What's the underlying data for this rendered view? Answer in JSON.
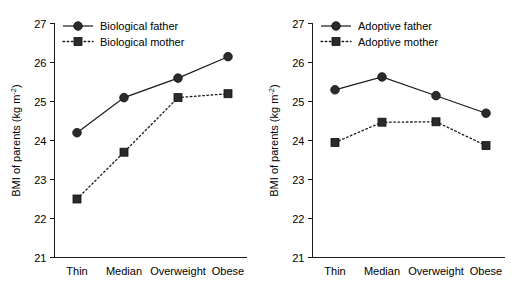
{
  "figure": {
    "panel_count": 2,
    "background": "#ffffff",
    "ink_color": "#1a1a1a"
  },
  "chart_data": [
    {
      "type": "line",
      "panel": "left",
      "title": "",
      "xlabel": "",
      "ylabel": "BMI of parents (kg m",
      "ylabel_sup": "-2",
      "ylabel_close": ")",
      "categories": [
        "Thin",
        "Median",
        "Overweight",
        "Obese"
      ],
      "ylim": [
        21,
        27
      ],
      "yticks": [
        21,
        22,
        23,
        24,
        25,
        26,
        27
      ],
      "ytick_labels": [
        "21",
        "22",
        "23",
        "24",
        "25",
        "26",
        "27"
      ],
      "grid": false,
      "legend_position": "top-left-inside",
      "series": [
        {
          "name": "Biological father",
          "marker": "circle",
          "linestyle": "solid",
          "color": "#2b2b2b",
          "values": [
            24.2,
            25.1,
            25.6,
            26.15
          ]
        },
        {
          "name": "Biological mother",
          "marker": "square",
          "linestyle": "dotted",
          "color": "#2b2b2b",
          "values": [
            22.5,
            23.7,
            25.1,
            25.2
          ]
        }
      ]
    },
    {
      "type": "line",
      "panel": "right",
      "title": "",
      "xlabel": "",
      "ylabel": "BMI of parents (kg m",
      "ylabel_sup": "-2",
      "ylabel_close": ")",
      "categories": [
        "Thin",
        "Median",
        "Overweight",
        "Obese"
      ],
      "ylim": [
        21,
        27
      ],
      "yticks": [
        21,
        22,
        23,
        24,
        25,
        26,
        27
      ],
      "ytick_labels": [
        "21",
        "22",
        "23",
        "24",
        "25",
        "26",
        "27"
      ],
      "grid": false,
      "legend_position": "top-left-inside",
      "series": [
        {
          "name": "Adoptive father",
          "marker": "circle",
          "linestyle": "solid",
          "color": "#2b2b2b",
          "values": [
            25.3,
            25.63,
            25.15,
            24.7
          ]
        },
        {
          "name": "Adoptive mother",
          "marker": "square",
          "linestyle": "dotted",
          "color": "#2b2b2b",
          "values": [
            23.95,
            24.47,
            24.48,
            23.87
          ]
        }
      ]
    }
  ]
}
